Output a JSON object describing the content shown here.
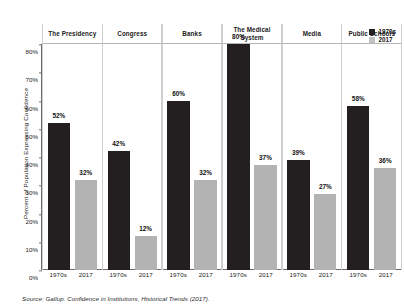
{
  "chart_data": {
    "type": "bar",
    "title": "",
    "xlabel": "",
    "ylabel": "Percent of Population Expressing Confidence",
    "ylim": [
      0,
      80
    ],
    "grid": false,
    "legend_position": "top-right",
    "categories": [
      "The Presidency",
      "Congress",
      "Banks",
      "The Medical System",
      "Media",
      "Public Schools"
    ],
    "x": [
      "1970s",
      "2017"
    ],
    "series": [
      {
        "name": "1970s",
        "color": "#231f20",
        "values": [
          52,
          42,
          60,
          80,
          39,
          58
        ]
      },
      {
        "name": "2017",
        "color": "#b3b3b3",
        "values": [
          32,
          12,
          32,
          37,
          27,
          36
        ]
      }
    ],
    "y_ticks": [
      "0%",
      "10%",
      "20%",
      "30%",
      "40%",
      "50%",
      "60%",
      "70%",
      "80%"
    ],
    "y_tick_values": [
      0,
      10,
      20,
      30,
      40,
      50,
      60,
      70,
      80
    ],
    "data_labels": [
      {
        "panel": "The Presidency",
        "series": "1970s",
        "label": "52%"
      },
      {
        "panel": "The Presidency",
        "series": "2017",
        "label": "32%"
      },
      {
        "panel": "Congress",
        "series": "1970s",
        "label": "42%"
      },
      {
        "panel": "Congress",
        "series": "2017",
        "label": "12%"
      },
      {
        "panel": "Banks",
        "series": "1970s",
        "label": "60%"
      },
      {
        "panel": "Banks",
        "series": "2017",
        "label": "32%"
      },
      {
        "panel": "The Medical System",
        "series": "1970s",
        "label": "80%"
      },
      {
        "panel": "The Medical System",
        "series": "2017",
        "label": "37%"
      },
      {
        "panel": "Media",
        "series": "1970s",
        "label": "39%"
      },
      {
        "panel": "Media",
        "series": "2017",
        "label": "27%"
      },
      {
        "panel": "Public Schools",
        "series": "1970s",
        "label": "58%"
      },
      {
        "panel": "Public Schools",
        "series": "2017",
        "label": "36%"
      }
    ],
    "annotations": {
      "source": "Source: Gallup. Confidence in Institutions, Historical Trends (2017)."
    }
  },
  "axis": {
    "y_title": "Percent of Population Expressing Confidence",
    "y_ticks": [
      "80%",
      "70%",
      "60%",
      "50%",
      "40%",
      "30%",
      "20%",
      "10%",
      "0%"
    ]
  },
  "panels": [
    {
      "strip_label": "The Presidency",
      "bars": [
        {
          "era": "1970s",
          "value": 52,
          "label": "52%"
        },
        {
          "era": "2017",
          "value": 32,
          "label": "32%"
        }
      ],
      "x_labels": [
        "1970s",
        "2017"
      ]
    },
    {
      "strip_label": "Congress",
      "bars": [
        {
          "era": "1970s",
          "value": 42,
          "label": "42%"
        },
        {
          "era": "2017",
          "value": 12,
          "label": "12%"
        }
      ],
      "x_labels": [
        "1970s",
        "2017"
      ]
    },
    {
      "strip_label": "Banks",
      "bars": [
        {
          "era": "1970s",
          "value": 60,
          "label": "60%"
        },
        {
          "era": "2017",
          "value": 32,
          "label": "32%"
        }
      ],
      "x_labels": [
        "1970s",
        "2017"
      ]
    },
    {
      "strip_label": "The Medical System",
      "bars": [
        {
          "era": "1970s",
          "value": 80,
          "label": "80%"
        },
        {
          "era": "2017",
          "value": 37,
          "label": "37%"
        }
      ],
      "x_labels": [
        "1970s",
        "2017"
      ]
    },
    {
      "strip_label": "Media",
      "bars": [
        {
          "era": "1970s",
          "value": 39,
          "label": "39%"
        },
        {
          "era": "2017",
          "value": 27,
          "label": "27%"
        }
      ],
      "x_labels": [
        "1970s",
        "2017"
      ]
    },
    {
      "strip_label": "Public Schools",
      "bars": [
        {
          "era": "1970s",
          "value": 58,
          "label": "58%"
        },
        {
          "era": "2017",
          "value": 36,
          "label": "36%"
        }
      ],
      "x_labels": [
        "1970s",
        "2017"
      ]
    }
  ],
  "legend": {
    "items": [
      {
        "label": "1970s",
        "era": "1970s",
        "color": "#231f20"
      },
      {
        "label": "2017",
        "era": "2017",
        "color": "#c2c2c2"
      }
    ]
  },
  "source": {
    "text": "Source: Gallup. Confidence in Institutions, Historical Trends (2017)."
  },
  "colors": {
    "bar_1970s": "#231f20",
    "bar_2017": "#b3b3b3",
    "axis": "#6b6b6b",
    "panel_border": "#cfcfcf",
    "background": "#ffffff"
  }
}
